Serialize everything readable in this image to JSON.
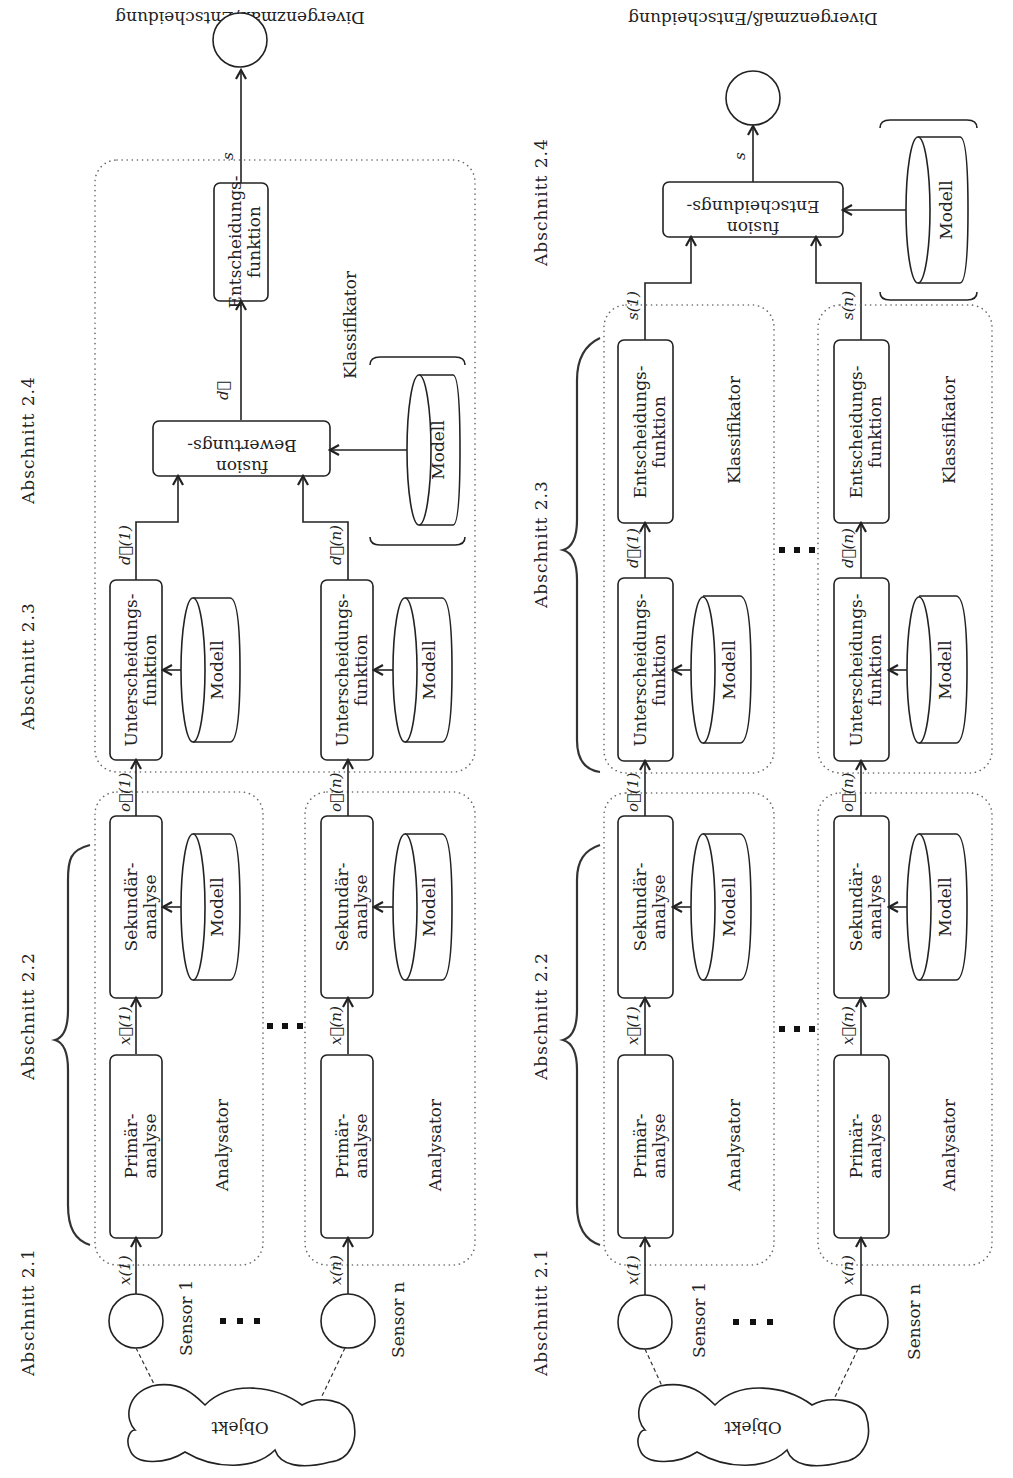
{
  "page": {
    "partial_header": ""
  },
  "diagrams": [
    {
      "id": "left",
      "output_label": "Divergenzmaß/Entscheidung",
      "sections": {
        "s21": "Abschnitt 2.1",
        "s22": "Abschnitt 2.2",
        "s23": "Abschnitt 2.3",
        "s24": "Abschnitt 2.4"
      },
      "object": "Objekt",
      "sensors": [
        "Sensor 1",
        "Sensor n"
      ],
      "signals": {
        "x1": "x(1)",
        "xn": "x(n)",
        "fx1": "x⃗(1)",
        "fxn": "x⃗(n)",
        "o1": "o⃗(1)",
        "on": "o⃗(n)",
        "d1": "d⃗(1)",
        "dn": "d⃗(n)",
        "d": "d⃗",
        "s": "s"
      },
      "blocks": {
        "primary_l1": "Primär-",
        "primary_l2": "analyse",
        "secondary_l1": "Sekundär-",
        "secondary_l2": "analyse",
        "discr_l1": "Unterscheidungs-",
        "discr_l2": "funktion",
        "fusion_l1": "Bewertungs-",
        "fusion_l2": "fusion",
        "decision_l1": "Entscheidungs-",
        "decision_l2": "funktion",
        "model": "Modell"
      },
      "groups": {
        "analyzer": "Analysator",
        "classifier": "Klassifikator"
      }
    },
    {
      "id": "right",
      "output_label": "Divergenzmaß/Entscheidung",
      "sections": {
        "s21": "Abschnitt 2.1",
        "s22": "Abschnitt 2.2",
        "s23": "Abschnitt 2.3",
        "s24": "Abschnitt 2.4"
      },
      "object": "Objekt",
      "sensors": [
        "Sensor 1",
        "Sensor n"
      ],
      "signals": {
        "x1": "x(1)",
        "xn": "x(n)",
        "fx1": "x⃗(1)",
        "fxn": "x⃗(n)",
        "o1": "o⃗(1)",
        "on": "o⃗(n)",
        "d1": "d⃗(1)",
        "dn": "d⃗(n)",
        "s1": "s(1)",
        "sn": "s(n)",
        "s": "s"
      },
      "blocks": {
        "primary_l1": "Primär-",
        "primary_l2": "analyse",
        "secondary_l1": "Sekundär-",
        "secondary_l2": "analyse",
        "discr_l1": "Unterscheidungs-",
        "discr_l2": "funktion",
        "decision_l1": "Entscheidungs-",
        "decision_l2": "funktion",
        "fusion_l1": "Entscheidungs-",
        "fusion_l2": "fusion",
        "model": "Modell"
      },
      "groups": {
        "analyzer": "Analysator",
        "classifier": "Klassifikator"
      }
    }
  ]
}
